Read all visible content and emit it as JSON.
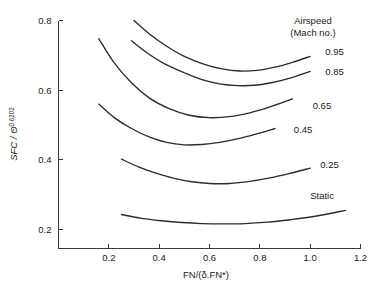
{
  "chart_data": {
    "type": "line",
    "title": "",
    "subtitle": "",
    "xlabel": "FN/(δ.FN*)",
    "ylabel_parts": {
      "main": "SFC / Θ",
      "exponent": "0.6202"
    },
    "ylabel": "SFC / Θ^0.6202",
    "xlim": [
      0,
      1.2
    ],
    "ylim": [
      0.15,
      0.8
    ],
    "xticks": [
      0.2,
      0.4,
      0.6,
      0.8,
      1.0,
      1.2
    ],
    "xtick_labels": [
      "0.2",
      "0.4",
      "0.6",
      "0.8",
      "1.0",
      "1.2"
    ],
    "yticks": [
      0.2,
      0.4,
      0.6,
      0.8
    ],
    "ytick_labels": [
      "0.2",
      "0.4",
      "0.6",
      "0.8"
    ],
    "grid": false,
    "legend_position": "right-inline",
    "legend_title_lines": [
      "Airspeed",
      "(Mach no.)"
    ],
    "series": [
      {
        "name": "0.95",
        "label": "0.95",
        "label_x": 1.06,
        "label_y": 0.712,
        "x": [
          0.3,
          0.36,
          0.43,
          0.5,
          0.58,
          0.65,
          0.72,
          0.79,
          0.86,
          0.93,
          1.0
        ],
        "y": [
          0.8,
          0.762,
          0.726,
          0.697,
          0.674,
          0.661,
          0.655,
          0.657,
          0.666,
          0.68,
          0.697
        ]
      },
      {
        "name": "0.85",
        "label": "0.85",
        "label_x": 1.06,
        "label_y": 0.652,
        "x": [
          0.29,
          0.35,
          0.42,
          0.5,
          0.57,
          0.64,
          0.71,
          0.78,
          0.85,
          0.93,
          1.0
        ],
        "y": [
          0.742,
          0.708,
          0.676,
          0.65,
          0.63,
          0.618,
          0.613,
          0.614,
          0.622,
          0.637,
          0.654
        ]
      },
      {
        "name": "0.65",
        "label": "0.65",
        "label_x": 1.01,
        "label_y": 0.557,
        "x": [
          0.16,
          0.22,
          0.29,
          0.36,
          0.44,
          0.52,
          0.6,
          0.68,
          0.76,
          0.84,
          0.93
        ],
        "y": [
          0.748,
          0.68,
          0.621,
          0.578,
          0.547,
          0.528,
          0.521,
          0.524,
          0.535,
          0.552,
          0.575
        ]
      },
      {
        "name": "0.45",
        "label": "0.45",
        "label_x": 0.935,
        "label_y": 0.487,
        "x": [
          0.16,
          0.22,
          0.29,
          0.36,
          0.43,
          0.5,
          0.57,
          0.64,
          0.71,
          0.78,
          0.86
        ],
        "y": [
          0.56,
          0.522,
          0.49,
          0.466,
          0.45,
          0.443,
          0.444,
          0.45,
          0.46,
          0.473,
          0.49
        ]
      },
      {
        "name": "0.25",
        "label": "0.25",
        "label_x": 1.04,
        "label_y": 0.385,
        "x": [
          0.25,
          0.32,
          0.39,
          0.46,
          0.53,
          0.6,
          0.68,
          0.76,
          0.84,
          0.92,
          1.0
        ],
        "y": [
          0.402,
          0.379,
          0.361,
          0.347,
          0.337,
          0.332,
          0.332,
          0.338,
          0.348,
          0.361,
          0.376
        ]
      },
      {
        "name": "Static",
        "label": "Static",
        "label_x": 1.0,
        "label_y": 0.296,
        "x": [
          0.25,
          0.33,
          0.41,
          0.49,
          0.57,
          0.65,
          0.74,
          0.83,
          0.92,
          1.02,
          1.14
        ],
        "y": [
          0.243,
          0.232,
          0.225,
          0.22,
          0.217,
          0.216,
          0.217,
          0.221,
          0.228,
          0.238,
          0.255
        ]
      }
    ]
  },
  "colors": {
    "curve": "#2b2b2b",
    "axis": "#3a3a3a",
    "text": "#1a1a1a",
    "background": "#ffffff"
  }
}
